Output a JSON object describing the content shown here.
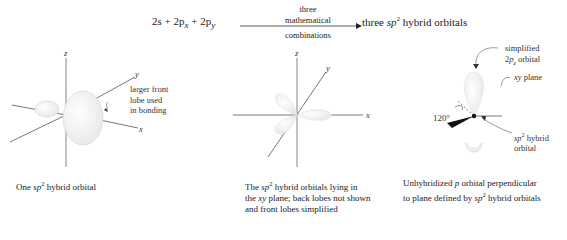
{
  "equation": {
    "reactants": [
      "2s",
      "2p",
      "x",
      "2p",
      "y"
    ],
    "arrow_top_1": "three",
    "arrow_top_2": "mathematical",
    "arrow_bottom": "combinations",
    "product_prefix": "three",
    "product_sp": "sp",
    "product_sup": "2",
    "product_suffix": "hybrid orbitals"
  },
  "panel1": {
    "axis_z": "z",
    "axis_y": "y",
    "axis_x": "x",
    "annotation_lines": [
      "larger front",
      "lobe used",
      "in bonding"
    ],
    "caption_pre": "One",
    "caption_sp": "sp",
    "caption_sup": "2",
    "caption_post": "hybrid orbital"
  },
  "panel2": {
    "axis_z": "z",
    "axis_y": "y",
    "axis_x": "x",
    "caption_line1_pre": "The",
    "caption_sp": "sp",
    "caption_sup": "2",
    "caption_line1_post": "hybrid orbitals lying in",
    "caption_line2_pre": "the",
    "caption_xy": "xy",
    "caption_line2_post": "plane; back lobes not shown",
    "caption_line3": "and front lobes simplified"
  },
  "panel3": {
    "label_simplified_1": "simplified",
    "label_simplified_2_pre": "2",
    "label_simplified_2_p": "p",
    "label_simplified_2_sub": "z",
    "label_simplified_2_post": "orbital",
    "label_xy": "xy",
    "label_plane": "plane",
    "angle": "120°",
    "label_hybrid_sp": "sp",
    "label_hybrid_sup": "2",
    "label_hybrid_post": "hybrid",
    "label_hybrid_line2": "orbital",
    "caption_line1_pre": "Unhybridized",
    "caption_p": "p",
    "caption_line1_post": "orbital perpendicular",
    "caption_line2_pre": "to plane defined by",
    "caption_sp": "sp",
    "caption_sup": "2",
    "caption_line2_post": "hybrid orbitals"
  },
  "colors": {
    "lobe_fill": "#f2f2f2",
    "lobe_stroke": "#d8d8d8",
    "axis": "#555555",
    "text": "#222222"
  }
}
